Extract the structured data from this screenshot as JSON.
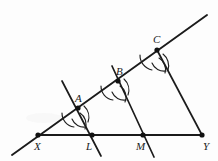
{
  "figure": {
    "type": "geometric-construction",
    "background_color": "#fdfdfd",
    "ink_color": "#1b1b1b",
    "width": 218,
    "height": 161
  },
  "labels": {
    "X": "X",
    "L": "L",
    "M": "M",
    "Y": "Y",
    "A": "A",
    "B": "B",
    "C": "C"
  },
  "points": {
    "X": {
      "x": 38,
      "y": 135,
      "label": "X",
      "label_x": 34,
      "label_y": 150
    },
    "L": {
      "x": 92,
      "y": 135,
      "label": "L",
      "label_x": 86,
      "label_y": 150
    },
    "M": {
      "x": 143,
      "y": 135,
      "label": "M",
      "label_x": 136,
      "label_y": 150
    },
    "Y": {
      "x": 202,
      "y": 135,
      "label": "Y",
      "label_x": 203,
      "label_y": 150
    },
    "A": {
      "x": 78,
      "y": 108,
      "label": "A",
      "label_x": 75,
      "label_y": 102
    },
    "B": {
      "x": 118,
      "y": 81,
      "label": "B",
      "label_x": 116,
      "label_y": 75
    },
    "C": {
      "x": 157,
      "y": 50,
      "label": "C",
      "label_x": 153,
      "label_y": 43
    }
  },
  "segments": {
    "ray_XC": {
      "x1": 12,
      "y1": 155,
      "x2": 207,
      "y2": 15,
      "name": "ray-through-X-A-B-C"
    },
    "base_XY": {
      "x1": 38,
      "y1": 135,
      "x2": 203,
      "y2": 135,
      "name": "base-segment-XY"
    },
    "line_A_L": {
      "x1": 62,
      "y1": 81,
      "x2": 101,
      "y2": 156,
      "name": "transversal-A-L"
    },
    "line_B_M": {
      "x1": 112,
      "y1": 66,
      "x2": 154,
      "y2": 157,
      "name": "transversal-B-M"
    },
    "line_C_Y": {
      "x1": 157,
      "y1": 50,
      "x2": 202,
      "y2": 135,
      "name": "transversal-C-Y"
    }
  },
  "arc_marks": [
    {
      "name": "arc-at-A-left",
      "d": "M 62 113 A 14 14 0 0 0 74 127"
    },
    {
      "name": "arc-at-A-right",
      "d": "M 84 106 A 15 15 0 0 1 88 122"
    },
    {
      "name": "arc-at-A-cross1",
      "d": "M 72 119 A 13 13 0 0 0 86 127"
    },
    {
      "name": "arc-at-A-cross2",
      "d": "M 80 113 A 13 13 0 0 1 85 129"
    },
    {
      "name": "arc-at-B-left",
      "d": "M 101 86 A 14 14 0 0 0 113 100"
    },
    {
      "name": "arc-at-B-right",
      "d": "M 124 79 A 15 15 0 0 1 128 95"
    },
    {
      "name": "arc-at-B-cross1",
      "d": "M 112 92 A 13 13 0 0 0 126 100"
    },
    {
      "name": "arc-at-B-cross2",
      "d": "M 120 86 A 13 13 0 0 1 125 102"
    },
    {
      "name": "arc-at-C-left",
      "d": "M 140 55 A 15 15 0 0 0 152 70"
    },
    {
      "name": "arc-at-C-right",
      "d": "M 163 54 A 15 15 0 0 1 168 70"
    },
    {
      "name": "arc-at-C-cross1",
      "d": "M 152 63 A 13 13 0 0 0 166 71"
    },
    {
      "name": "arc-at-C-cross2",
      "d": "M 159 58 A 13 13 0 0 1 165 73"
    }
  ]
}
